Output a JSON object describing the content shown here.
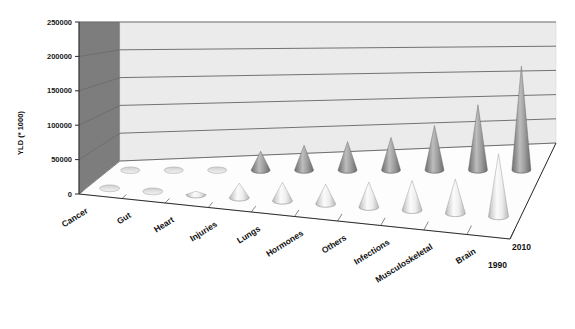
{
  "chart_data": {
    "type": "bar",
    "render_style": "3d-cone",
    "title": "",
    "subtitle": "",
    "xlabel": "",
    "ylabel": "YLD (* 1000)",
    "zlabel": "",
    "ylim": [
      0,
      250000
    ],
    "ytick_labels": [
      "0",
      "50000",
      "100000",
      "150000",
      "200000",
      "250000"
    ],
    "ytick_values": [
      0,
      50000,
      100000,
      150000,
      200000,
      250000
    ],
    "grid": true,
    "legend_position": "right-depth-axis",
    "categories": [
      "Cancer",
      "Gut",
      "Heart",
      "Injuries",
      "Lungs",
      "Hormones",
      "Others",
      "Infections",
      "Musculoskeletal",
      "Brain"
    ],
    "depth_labels": [
      "1990",
      "2010"
    ],
    "series": [
      {
        "name": "1990",
        "color": "#ededed",
        "values": [
          500,
          800,
          5000,
          22000,
          28000,
          30000,
          38000,
          45000,
          52000,
          95000
        ]
      },
      {
        "name": "2010",
        "color": "#9a9a9a",
        "values": [
          600,
          900,
          1200,
          32000,
          42000,
          48000,
          55000,
          75000,
          110000,
          175000
        ]
      }
    ]
  },
  "colors": {
    "back_wall": "#e9e9e9",
    "side_wall": "#7d7d7d",
    "floor": "#fdfdfd",
    "gridline": "#4a4a4a",
    "axis_line": "#2b2b2b",
    "series_1990": "#ededed",
    "series_2010": "#9a9a9a",
    "text": "#111111"
  },
  "axis": {
    "y_title": "YLD (* 1000)",
    "ticks": [
      "250000",
      "200000",
      "150000",
      "100000",
      "50000",
      "0"
    ]
  },
  "legend": {
    "entries": [
      "2010",
      "1990"
    ]
  }
}
